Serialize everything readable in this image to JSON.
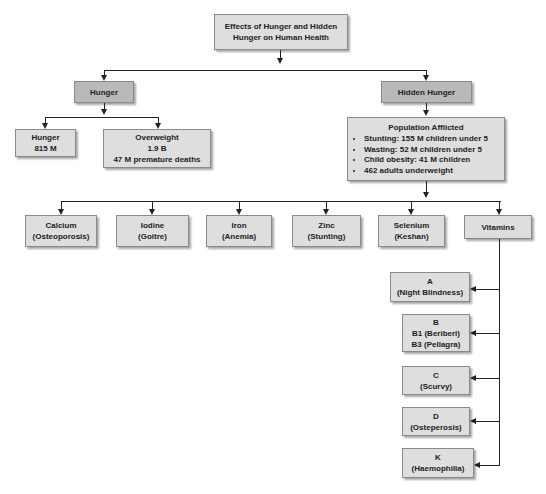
{
  "title": "Effects of Hunger and Hidden Hunger on Human Health",
  "title_lines": [
    "Effects of Hunger and Hidden",
    "Hunger on Human Health"
  ],
  "colors": {
    "box_fill": "#dedede",
    "box_fill_dark": "#b9b9b9",
    "line": "#222222",
    "border": "#8a8a8a"
  },
  "hunger": {
    "label": "Hunger",
    "children": [
      {
        "lines": [
          "Hunger",
          "815 M"
        ]
      },
      {
        "lines": [
          "Overweight",
          "1.9 B",
          "47 M premature deaths"
        ]
      }
    ]
  },
  "hidden_hunger": {
    "label": "Hidden Hunger",
    "population": {
      "title": "Population Afflicted",
      "items": [
        "Stunting: 155 M children under 5",
        "Wasting: 52 M children under 5",
        "Child obesity: 41 M children",
        "462 adults underweight"
      ]
    },
    "deficiencies": [
      {
        "lines": [
          "Calcium",
          "(Osteoporosis)"
        ]
      },
      {
        "lines": [
          "Iodine",
          "(Goitre)"
        ]
      },
      {
        "lines": [
          "Iron",
          "(Anemia)"
        ]
      },
      {
        "lines": [
          "Zinc",
          "(Stunting)"
        ]
      },
      {
        "lines": [
          "Selenium",
          "(Keshan)"
        ]
      },
      {
        "lines": [
          "Vitamins"
        ]
      }
    ],
    "vitamins": [
      {
        "lines": [
          "A",
          "(Night Blindness)"
        ]
      },
      {
        "lines": [
          "B",
          "B1 (Beriberi)",
          "B3 (Pellagra)"
        ]
      },
      {
        "lines": [
          "C",
          "(Scurvy)"
        ]
      },
      {
        "lines": [
          "D",
          "(Osteperosis)"
        ]
      },
      {
        "lines": [
          "K",
          "(Haemophilia)"
        ]
      }
    ]
  }
}
